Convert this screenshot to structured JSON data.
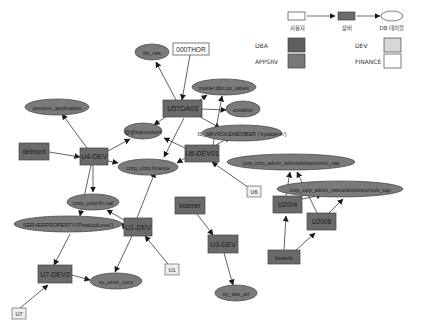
{
  "legend": {
    "flow": [
      {
        "shape": "user-box",
        "label": "사용자"
      },
      {
        "shape": "device-box",
        "label": "장비"
      },
      {
        "shape": "table-ellipse",
        "label": "DB 테이블"
      }
    ],
    "categories": [
      {
        "label": "DBA",
        "color": "#5e5e5e"
      },
      {
        "label": "APPSRV",
        "color": "#787878"
      },
      {
        "label": "DEV",
        "color": "#d8d8d8"
      },
      {
        "label": "FINANCE",
        "color": "#ffffff"
      }
    ]
  },
  "colors": {
    "device_fill": "#6e6e6e",
    "table_fill": "#7a7a7a",
    "user_fill": "#eeeeee",
    "edge": "#333333"
  },
  "nodes": {
    "users": [
      {
        "id": "000THOR",
        "label": "000THOR"
      },
      {
        "id": "U6",
        "label": "U6"
      },
      {
        "id": "U1",
        "label": "U1"
      },
      {
        "id": "U7",
        "label": "U7"
      }
    ],
    "devices": [
      {
        "id": "U5TDA03",
        "label": "U5TDA03"
      },
      {
        "id": "delmont",
        "label": "delmont"
      },
      {
        "id": "U4-DEV",
        "label": "U4-DEV"
      },
      {
        "id": "U6-DEV01",
        "label": "U6-DEV01"
      },
      {
        "id": "kosmer",
        "label": "kosmer"
      },
      {
        "id": "U1-DEV",
        "label": "U1-DEV"
      },
      {
        "id": "U3-DEV",
        "label": "U3-DEV"
      },
      {
        "id": "U2004",
        "label": "U2004"
      },
      {
        "id": "U2008",
        "label": "U2008"
      },
      {
        "id": "bizevb",
        "label": "bizevb"
      },
      {
        "id": "U7-DEV2",
        "label": "U7-DEV2"
      }
    ],
    "tables": [
      {
        "id": "fin_res",
        "label": "fin_res"
      },
      {
        "id": "master_dbo",
        "label": "master.dbo.spt_values"
      },
      {
        "id": "creditor",
        "label": "creditor"
      },
      {
        "id": "pension",
        "label": "pension_application"
      },
      {
        "id": "transaction",
        "label": "@@transcount"
      },
      {
        "id": "is_member",
        "label": "IS_SRVROLEMEMBER ('sysadmin')"
      },
      {
        "id": "corp_finance",
        "label": "corp_corp.finance"
      },
      {
        "id": "admin_select1",
        "label": "corp_corp_admin_select/divisionmetric_sap"
      },
      {
        "id": "admin_select2",
        "label": "corp_corp_admin_select/divisioncurrculs_sap"
      },
      {
        "id": "corp_fin_sal",
        "label": "corp_corp.fin.sal"
      },
      {
        "id": "serverproperty",
        "label": "SERVERPROPERTY('ProductLevel')"
      },
      {
        "id": "sy_error",
        "label": "sy_error_corp"
      },
      {
        "id": "sy_site",
        "label": "sy_site_url"
      }
    ]
  }
}
